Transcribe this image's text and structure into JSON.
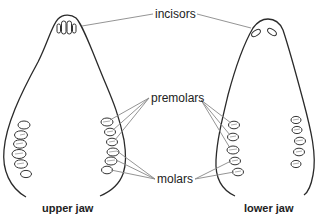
{
  "labels": {
    "incisors": "incisors",
    "premolars": "premolars",
    "molars": "molars"
  },
  "captions": {
    "upper": "upper jaw",
    "lower": "lower jaw"
  },
  "colors": {
    "outline": "#2a2a2a",
    "leader": "#888888",
    "text": "#222222",
    "background": "#ffffff"
  }
}
